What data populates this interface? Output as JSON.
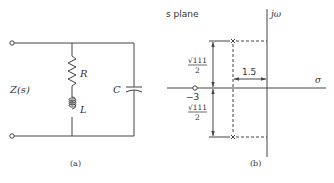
{
  "circuit": {
    "impedance_label": "Z(s)",
    "resistor_label": "R",
    "inductor_label": "L",
    "capacitor_label": "C",
    "caption": "(a)"
  },
  "splane": {
    "title": "s plane",
    "imag_axis_label": "jω",
    "real_axis_label": "σ",
    "zero_label": "−3",
    "distance_label": "1.5",
    "upper_height_num": "√111",
    "upper_height_den": "2",
    "lower_height_num": "√111",
    "lower_height_den": "2",
    "caption": "(b)",
    "zero_position": -3,
    "poles": [
      {
        "real": -1.5,
        "imag": "√111/2"
      },
      {
        "real": -1.5,
        "imag": "-√111/2"
      }
    ]
  },
  "colors": {
    "line": "#444444",
    "text": "#333333"
  }
}
